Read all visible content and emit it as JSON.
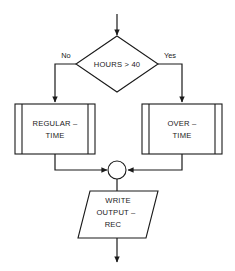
{
  "diagram": {
    "background_color": "#ffffff",
    "line_color": "#1a1a1a",
    "entry": {
      "label": "entry-arrow"
    },
    "decision": {
      "shape": "diamond",
      "text": "HOURS > 40",
      "branch_no": "No",
      "branch_yes": "Yes"
    },
    "process_left": {
      "shape": "predefined-process",
      "line1": "REGULAR –",
      "line2": "TIME"
    },
    "process_right": {
      "shape": "predefined-process",
      "line1": "OVER –",
      "line2": "TIME"
    },
    "merge": {
      "shape": "connector-circle"
    },
    "output": {
      "shape": "parallelogram",
      "line1": "WRITE",
      "line2": "OUTPUT –",
      "line3": "REC"
    },
    "exit": {
      "label": "exit-arrow"
    }
  }
}
